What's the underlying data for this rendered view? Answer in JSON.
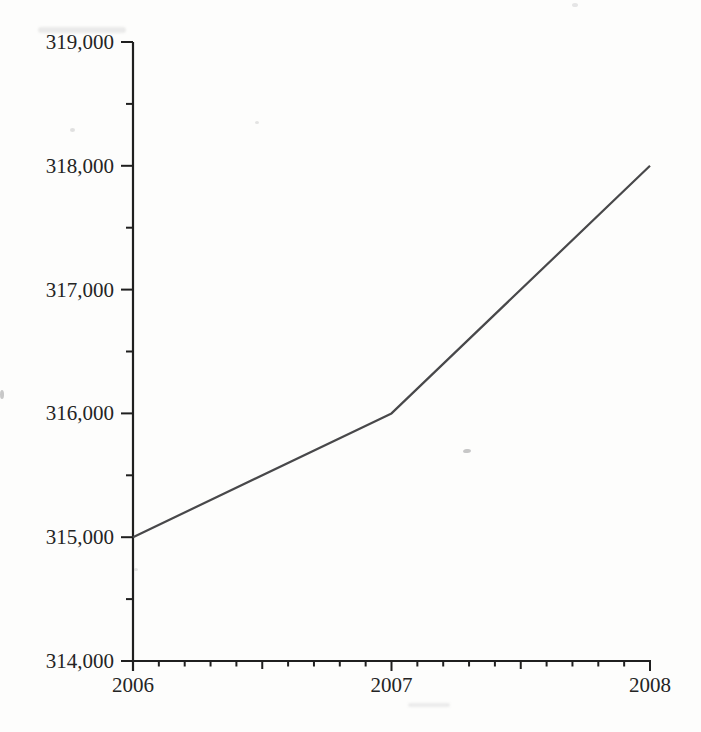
{
  "figure": {
    "background_color": "#fdfdfc"
  },
  "chart_data": {
    "type": "line",
    "title": "",
    "xlabel": "",
    "ylabel": "",
    "x": [
      2006,
      2007,
      2008
    ],
    "values": [
      315000,
      316000,
      318000
    ],
    "xlim": [
      2006,
      2008
    ],
    "ylim": [
      314000,
      319000
    ],
    "y_major_ticks": [
      {
        "value": 314000,
        "label": "314,000"
      },
      {
        "value": 315000,
        "label": "315,000"
      },
      {
        "value": 316000,
        "label": "316,000"
      },
      {
        "value": 317000,
        "label": "317,000"
      },
      {
        "value": 318000,
        "label": "318,000"
      },
      {
        "value": 319000,
        "label": "319,000"
      }
    ],
    "x_major_ticks": [
      {
        "value": 2006,
        "label": "2006"
      },
      {
        "value": 2007,
        "label": "2007"
      },
      {
        "value": 2008,
        "label": "2008"
      }
    ],
    "y_minor_step": 500,
    "x_minor_step": 0.1,
    "x_mid_step": 0.5,
    "grid": false,
    "legend_position": "none",
    "axis_color": "#1f1f1f",
    "tick_label_color": "#242424",
    "line_color": "#48484a"
  }
}
